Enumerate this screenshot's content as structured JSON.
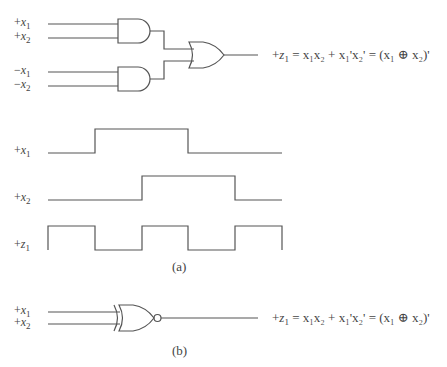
{
  "figure_a": {
    "caption": "(a)",
    "inputs": [
      {
        "sign": "+",
        "var": "x",
        "sub": "1"
      },
      {
        "sign": "+",
        "var": "x",
        "sub": "2"
      },
      {
        "sign": "−",
        "var": "x",
        "sub": "1"
      },
      {
        "sign": "−",
        "var": "x",
        "sub": "2"
      }
    ],
    "gates": [
      "AND",
      "AND",
      "OR"
    ],
    "equation": {
      "lhs_sign": "+",
      "lhs_var": "z",
      "lhs_sub": "1",
      "rhs": "= x₁x₂ + x₁'x₂' = (x₁ ⊕ x₂)'"
    },
    "waveforms": [
      {
        "label_sign": "+",
        "label_var": "x",
        "label_sub": "1",
        "levels": [
          0,
          1,
          1,
          0,
          0
        ]
      },
      {
        "label_sign": "+",
        "label_var": "x",
        "label_sub": "2",
        "levels": [
          0,
          0,
          1,
          1,
          0
        ]
      },
      {
        "label_sign": "+",
        "label_var": "z",
        "label_sub": "1",
        "levels": [
          1,
          0,
          1,
          0,
          1
        ]
      }
    ]
  },
  "figure_b": {
    "caption": "(b)",
    "inputs": [
      {
        "sign": "+",
        "var": "x",
        "sub": "1"
      },
      {
        "sign": "+",
        "var": "x",
        "sub": "2"
      }
    ],
    "gates": [
      "XNOR"
    ],
    "equation": {
      "lhs_sign": "+",
      "lhs_var": "z",
      "lhs_sub": "1",
      "rhs": "= x₁x₂ + x₁'x₂' = (x₁ ⊕ x₂)'"
    }
  }
}
